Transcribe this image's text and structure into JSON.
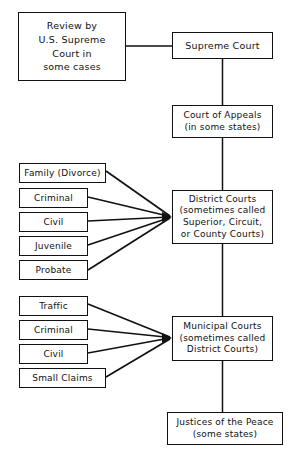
{
  "diagram": {
    "stroke_color": "#111111",
    "background_color": "#ffffff",
    "nodes": {
      "review": {
        "lines": [
          "Review by",
          "U.S. Supreme",
          "Court in",
          "some cases"
        ]
      },
      "supreme": {
        "lines": [
          "Supreme Court"
        ]
      },
      "appeals": {
        "lines": [
          "Court  of  Appeals",
          "(in some states)"
        ]
      },
      "district": {
        "lines": [
          "District Courts",
          "(sometimes called",
          "Superior,  Circuit,",
          "or  County  Courts)"
        ]
      },
      "municipal": {
        "lines": [
          "Municipal Courts",
          "(sometimes called",
          "District Courts)"
        ]
      },
      "justices": {
        "lines": [
          "Justices of the Peace",
          "(some states)"
        ]
      },
      "family": {
        "lines": [
          "Family  (Divorce)"
        ]
      },
      "criminal1": {
        "lines": [
          "Criminal"
        ]
      },
      "civil1": {
        "lines": [
          "Civil"
        ]
      },
      "juvenile": {
        "lines": [
          "Juvenile"
        ]
      },
      "probate": {
        "lines": [
          "Probate"
        ]
      },
      "traffic": {
        "lines": [
          "Traffic"
        ]
      },
      "criminal2": {
        "lines": [
          "Criminal"
        ]
      },
      "civil2": {
        "lines": [
          "Civil"
        ]
      },
      "small_claims": {
        "lines": [
          "Small Claims"
        ]
      }
    },
    "edges": [
      {
        "from": "review",
        "to": "supreme",
        "style": "horizontal"
      },
      {
        "from": "supreme",
        "to": "appeals",
        "style": "vertical"
      },
      {
        "from": "appeals",
        "to": "district",
        "style": "vertical"
      },
      {
        "from": "district",
        "to": "municipal",
        "style": "vertical"
      },
      {
        "from": "municipal",
        "to": "justices",
        "style": "vertical"
      },
      {
        "from": "family",
        "to": "district",
        "style": "diagonal-arrow"
      },
      {
        "from": "criminal1",
        "to": "district",
        "style": "diagonal-arrow"
      },
      {
        "from": "civil1",
        "to": "district",
        "style": "horizontal-arrow"
      },
      {
        "from": "juvenile",
        "to": "district",
        "style": "diagonal-arrow"
      },
      {
        "from": "probate",
        "to": "district",
        "style": "diagonal-arrow"
      },
      {
        "from": "traffic",
        "to": "municipal",
        "style": "diagonal-arrow"
      },
      {
        "from": "criminal2",
        "to": "municipal",
        "style": "diagonal-arrow"
      },
      {
        "from": "civil2",
        "to": "municipal",
        "style": "horizontal-arrow"
      },
      {
        "from": "small_claims",
        "to": "municipal",
        "style": "diagonal-arrow"
      }
    ]
  }
}
